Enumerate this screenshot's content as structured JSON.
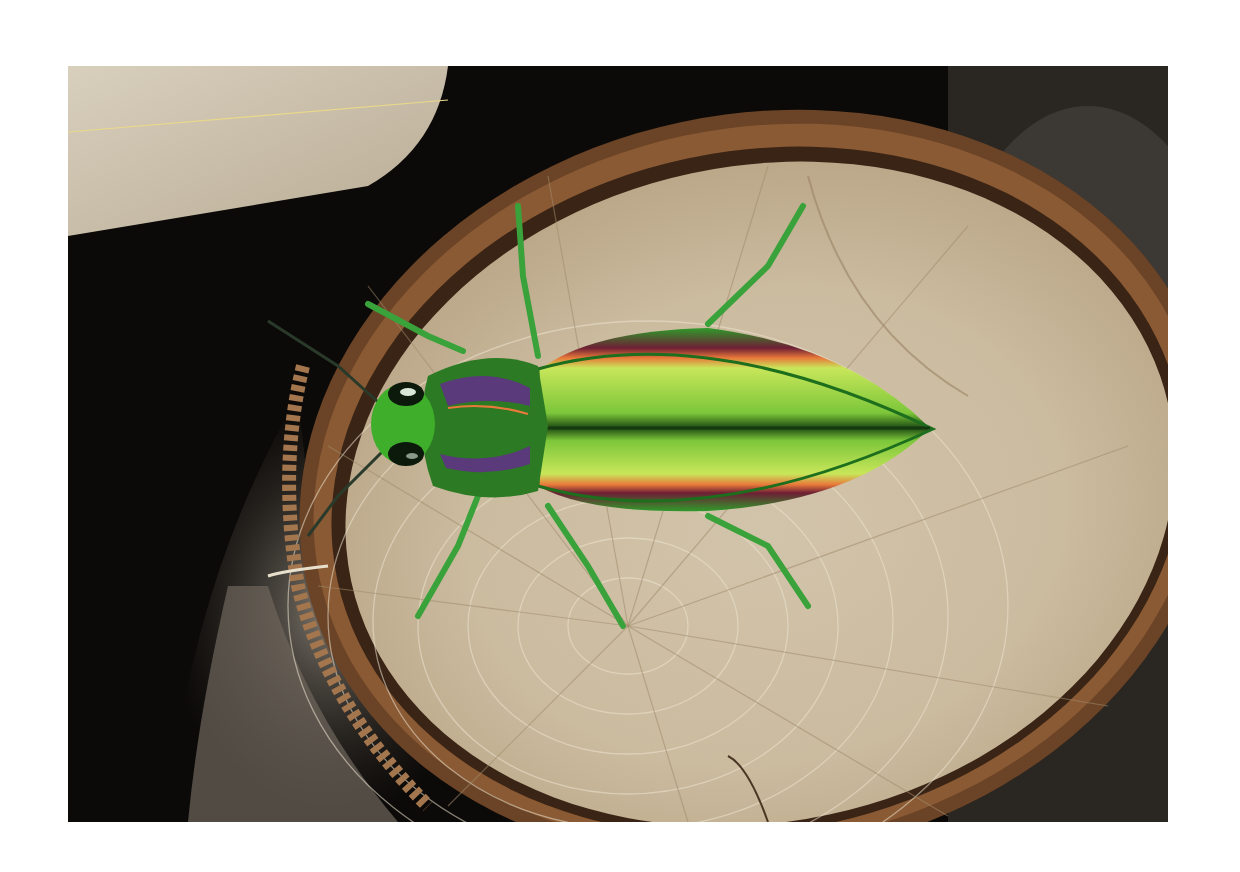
{
  "image": {
    "alt": "Iridescent green jewel beetle with red-purple stripes on a cut log end",
    "subject": "jewel beetle",
    "setting": "cut log cross-section with tree rings and bark",
    "colors": {
      "background_frame": "#ffffff",
      "dark_background": "#0c0a08",
      "wood_light": "#d8cbb4",
      "wood_mid": "#b9a68a",
      "bark": "#7a4e2e",
      "beetle_green": "#3fae2a",
      "beetle_light_green": "#b6e04a",
      "beetle_stripe": "#6e1f35",
      "stripe_edge": "#e8793a"
    }
  }
}
